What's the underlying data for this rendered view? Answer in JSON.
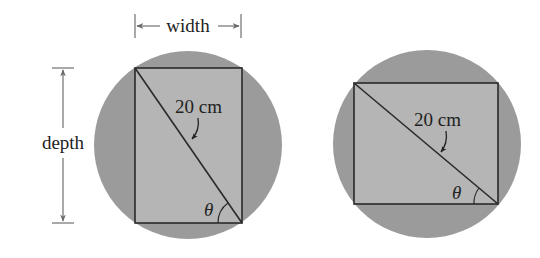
{
  "figure": {
    "colors": {
      "background": "#ffffff",
      "log_cross_section": "#9b9b9b",
      "beam_cross_section": "#b5b5b5",
      "outline": "#2a2a2a",
      "dimension_lines": "#707070",
      "text": "#222222"
    },
    "left_panel": {
      "width_label": "width",
      "depth_label": "depth",
      "diagonal_label": "20 cm",
      "angle_label": "θ"
    },
    "right_panel": {
      "diagonal_label": "20 cm",
      "angle_label": "θ"
    }
  }
}
